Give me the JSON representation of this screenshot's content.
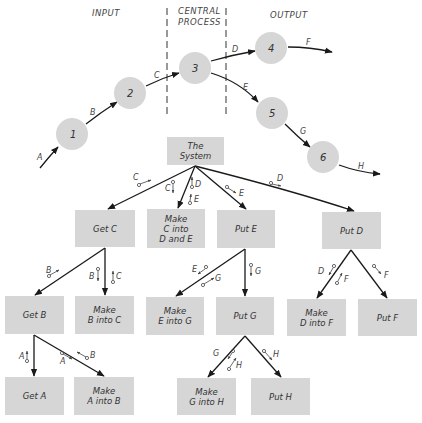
{
  "colors": {
    "node_fill": "#d6d6d6",
    "box_fill": "#d6d6d6",
    "line": "#1a1a1a",
    "text": "#333333"
  },
  "flow_diagram": {
    "headers": {
      "input": "INPUT",
      "central_line1": "CENTRAL",
      "central_line2": "PROCESS",
      "output": "OUTPUT"
    },
    "nodes": [
      {
        "id": "1",
        "label": "1"
      },
      {
        "id": "2",
        "label": "2"
      },
      {
        "id": "3",
        "label": "3"
      },
      {
        "id": "4",
        "label": "4"
      },
      {
        "id": "5",
        "label": "5"
      },
      {
        "id": "6",
        "label": "6"
      }
    ],
    "edges": [
      {
        "label": "A",
        "from": "",
        "to": "1"
      },
      {
        "label": "B",
        "from": "1",
        "to": "2"
      },
      {
        "label": "C",
        "from": "2",
        "to": "3"
      },
      {
        "label": "D",
        "from": "3",
        "to": "4"
      },
      {
        "label": "E",
        "from": "3",
        "to": "5"
      },
      {
        "label": "F",
        "from": "4",
        "to": ""
      },
      {
        "label": "G",
        "from": "5",
        "to": "6"
      },
      {
        "label": "H",
        "from": "6",
        "to": ""
      }
    ]
  },
  "structure_chart": {
    "modules": {
      "system": {
        "line1": "The",
        "line2": "System"
      },
      "get_c": {
        "line1": "Get C"
      },
      "make_c": {
        "line1": "Make",
        "line2": "C into",
        "line3": "D and E"
      },
      "put_e": {
        "line1": "Put E"
      },
      "put_d": {
        "line1": "Put D"
      },
      "get_b": {
        "line1": "Get B"
      },
      "make_b": {
        "line1": "Make",
        "line2": "B into C"
      },
      "make_e": {
        "line1": "Make",
        "line2": "E into G"
      },
      "put_g": {
        "line1": "Put G"
      },
      "make_d": {
        "line1": "Make",
        "line2": "D into F"
      },
      "put_f": {
        "line1": "Put F"
      },
      "get_a": {
        "line1": "Get A"
      },
      "make_a": {
        "line1": "Make",
        "line2": "A into B"
      },
      "make_g": {
        "line1": "Make",
        "line2": "G into H"
      },
      "put_h": {
        "line1": "Put H"
      }
    },
    "couples": {
      "sys_getc": "C",
      "sys_makec_in": "C",
      "sys_makec_out1": "D",
      "sys_makec_out2": "E",
      "sys_pute": "E",
      "sys_putd": "D",
      "getc_getb": "B",
      "getc_makeb_in": "B",
      "getc_makeb_out": "C",
      "getb_geta": "A",
      "getb_makea_in": "A",
      "getb_makea_out": "B",
      "pute_makee_in": "E",
      "pute_makee_out": "G",
      "pute_putg": "G",
      "putg_makeg_in": "G",
      "putg_makeg_out": "H",
      "putg_puth": "H",
      "putd_maked_in": "D",
      "putd_maked_out": "F",
      "putd_putf": "F"
    }
  }
}
